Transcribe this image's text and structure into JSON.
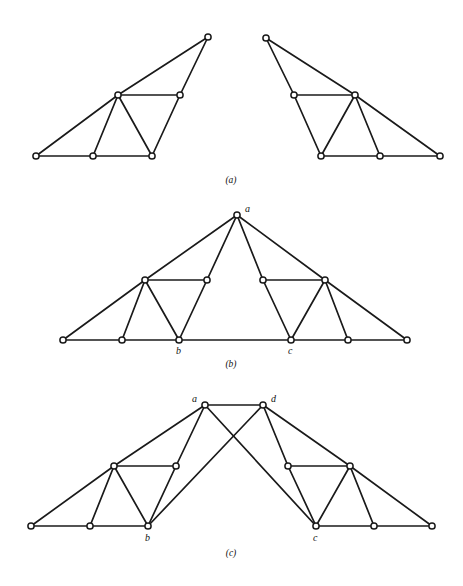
{
  "figure": {
    "background_color": "#ffffff",
    "ink_color": "#1a1a1a",
    "node_fill": "#ffffff",
    "width": 463,
    "height": 586,
    "panels": [
      {
        "id": "a",
        "caption": "(a)",
        "caption_pos": {
          "x": 231,
          "y": 183
        },
        "subgraphs": [
          {
            "id": "a-left",
            "name": "left-graph",
            "nodes": [
              {
                "id": "L0",
                "x": 36,
                "y": 156,
                "label": ""
              },
              {
                "id": "L1",
                "x": 93,
                "y": 156,
                "label": ""
              },
              {
                "id": "L2",
                "x": 152,
                "y": 156,
                "label": ""
              },
              {
                "id": "L3",
                "x": 118,
                "y": 95,
                "label": ""
              },
              {
                "id": "L4",
                "x": 180,
                "y": 95,
                "label": ""
              },
              {
                "id": "L5",
                "x": 208,
                "y": 37,
                "label": ""
              }
            ],
            "edges": [
              [
                "L0",
                "L1"
              ],
              [
                "L1",
                "L2"
              ],
              [
                "L0",
                "L3"
              ],
              [
                "L1",
                "L3"
              ],
              [
                "L2",
                "L3"
              ],
              [
                "L3",
                "L4"
              ],
              [
                "L2",
                "L4"
              ],
              [
                "L3",
                "L5"
              ],
              [
                "L4",
                "L5"
              ]
            ]
          },
          {
            "id": "a-right",
            "name": "right-graph",
            "nodes": [
              {
                "id": "R0",
                "x": 440,
                "y": 156,
                "label": ""
              },
              {
                "id": "R1",
                "x": 380,
                "y": 156,
                "label": ""
              },
              {
                "id": "R2",
                "x": 321,
                "y": 156,
                "label": ""
              },
              {
                "id": "R3",
                "x": 355,
                "y": 95,
                "label": ""
              },
              {
                "id": "R4",
                "x": 294,
                "y": 95,
                "label": ""
              },
              {
                "id": "R5",
                "x": 266,
                "y": 38,
                "label": ""
              }
            ],
            "edges": [
              [
                "R0",
                "R1"
              ],
              [
                "R1",
                "R2"
              ],
              [
                "R0",
                "R3"
              ],
              [
                "R1",
                "R3"
              ],
              [
                "R2",
                "R3"
              ],
              [
                "R3",
                "R4"
              ],
              [
                "R2",
                "R4"
              ],
              [
                "R3",
                "R5"
              ],
              [
                "R4",
                "R5"
              ]
            ]
          }
        ]
      },
      {
        "id": "b",
        "caption": "(b)",
        "caption_pos": {
          "x": 231,
          "y": 367
        },
        "subgraphs": [
          {
            "id": "b-graph",
            "name": "merged-graph",
            "nodes": [
              {
                "id": "B0",
                "x": 63,
                "y": 340,
                "label": ""
              },
              {
                "id": "B1",
                "x": 122,
                "y": 340,
                "label": ""
              },
              {
                "id": "B2",
                "x": 179,
                "y": 340,
                "label": "b",
                "label_dx": -3,
                "label_dy": 14
              },
              {
                "id": "B3",
                "x": 145,
                "y": 280,
                "label": ""
              },
              {
                "id": "B4",
                "x": 207,
                "y": 280,
                "label": ""
              },
              {
                "id": "A",
                "x": 237,
                "y": 215,
                "label": "a",
                "label_dx": 8,
                "label_dy": -3
              },
              {
                "id": "C0",
                "x": 407,
                "y": 340,
                "label": ""
              },
              {
                "id": "C1",
                "x": 348,
                "y": 340,
                "label": ""
              },
              {
                "id": "C2",
                "x": 291,
                "y": 340,
                "label": "c",
                "label_dx": -3,
                "label_dy": 14
              },
              {
                "id": "C3",
                "x": 325,
                "y": 280,
                "label": ""
              },
              {
                "id": "C4",
                "x": 263,
                "y": 280,
                "label": ""
              }
            ],
            "edges": [
              [
                "B0",
                "B1"
              ],
              [
                "B1",
                "B2"
              ],
              [
                "B0",
                "B3"
              ],
              [
                "B1",
                "B3"
              ],
              [
                "B2",
                "B3"
              ],
              [
                "B3",
                "B4"
              ],
              [
                "B2",
                "B4"
              ],
              [
                "B3",
                "A"
              ],
              [
                "B4",
                "A"
              ],
              [
                "C0",
                "C1"
              ],
              [
                "C1",
                "C2"
              ],
              [
                "C0",
                "C3"
              ],
              [
                "C1",
                "C3"
              ],
              [
                "C2",
                "C3"
              ],
              [
                "C3",
                "C4"
              ],
              [
                "C2",
                "C4"
              ],
              [
                "C3",
                "A"
              ],
              [
                "C4",
                "A"
              ],
              [
                "B2",
                "C2"
              ]
            ]
          }
        ]
      },
      {
        "id": "c",
        "caption": "(c)",
        "caption_pos": {
          "x": 231,
          "y": 556
        },
        "subgraphs": [
          {
            "id": "c-graph",
            "name": "crossed-graph",
            "nodes": [
              {
                "id": "P0",
                "x": 31,
                "y": 526,
                "label": ""
              },
              {
                "id": "P1",
                "x": 90,
                "y": 526,
                "label": ""
              },
              {
                "id": "P2",
                "x": 148,
                "y": 526,
                "label": "b",
                "label_dx": -3,
                "label_dy": 15
              },
              {
                "id": "P3",
                "x": 114,
                "y": 466,
                "label": ""
              },
              {
                "id": "P4",
                "x": 176,
                "y": 466,
                "label": ""
              },
              {
                "id": "PA",
                "x": 205,
                "y": 405,
                "label": "a",
                "label_dx": -13,
                "label_dy": -3
              },
              {
                "id": "Q0",
                "x": 432,
                "y": 526,
                "label": ""
              },
              {
                "id": "Q1",
                "x": 374,
                "y": 526,
                "label": ""
              },
              {
                "id": "Q2",
                "x": 316,
                "y": 526,
                "label": "c",
                "label_dx": -3,
                "label_dy": 15
              },
              {
                "id": "Q3",
                "x": 350,
                "y": 466,
                "label": ""
              },
              {
                "id": "Q4",
                "x": 288,
                "y": 466,
                "label": ""
              },
              {
                "id": "QD",
                "x": 263,
                "y": 405,
                "label": "d",
                "label_dx": 8,
                "label_dy": -3
              }
            ],
            "edges": [
              [
                "P0",
                "P1"
              ],
              [
                "P1",
                "P2"
              ],
              [
                "P0",
                "P3"
              ],
              [
                "P1",
                "P3"
              ],
              [
                "P2",
                "P3"
              ],
              [
                "P3",
                "P4"
              ],
              [
                "P2",
                "P4"
              ],
              [
                "P3",
                "PA"
              ],
              [
                "P4",
                "PA"
              ],
              [
                "Q0",
                "Q1"
              ],
              [
                "Q1",
                "Q2"
              ],
              [
                "Q0",
                "Q3"
              ],
              [
                "Q1",
                "Q3"
              ],
              [
                "Q2",
                "Q3"
              ],
              [
                "Q3",
                "Q4"
              ],
              [
                "Q2",
                "Q4"
              ],
              [
                "Q3",
                "QD"
              ],
              [
                "Q4",
                "QD"
              ],
              [
                "PA",
                "QD"
              ],
              [
                "PA",
                "Q2"
              ],
              [
                "QD",
                "P2"
              ]
            ]
          }
        ]
      }
    ]
  }
}
